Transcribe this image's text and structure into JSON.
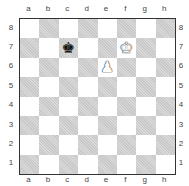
{
  "board": {
    "files": [
      "a",
      "b",
      "c",
      "d",
      "e",
      "f",
      "g",
      "h"
    ],
    "ranks": [
      "8",
      "7",
      "6",
      "5",
      "4",
      "3",
      "2",
      "1"
    ],
    "colors": {
      "light": "#ffffff",
      "dark": "#d9d9d9",
      "border": "#333333"
    },
    "pieces": [
      {
        "square": "c7",
        "piece": "king",
        "color": "black",
        "glyph": "♚",
        "icon": "black-king-icon"
      },
      {
        "square": "f7",
        "piece": "king",
        "color": "white",
        "glyph": "♚",
        "icon": "white-king-icon"
      },
      {
        "square": "e6",
        "piece": "pawn",
        "color": "white",
        "glyph": "♟",
        "icon": "white-pawn-icon"
      }
    ]
  }
}
